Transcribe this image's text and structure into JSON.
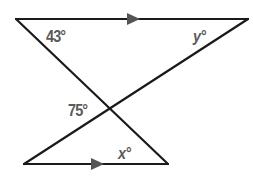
{
  "diagram": {
    "type": "geometry",
    "parallel_marker": "arrow",
    "angles": {
      "top_left": "43°",
      "top_right": "y°",
      "intersection_left": "75°",
      "bottom_right": "x°"
    },
    "colors": {
      "line": "#1a1a1a",
      "label": "#5a5a5a",
      "arrow": "#555555",
      "background": "#ffffff"
    }
  }
}
